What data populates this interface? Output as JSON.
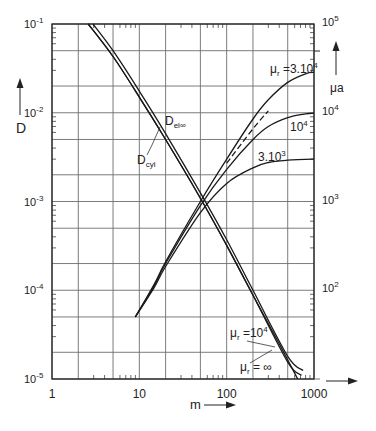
{
  "chart_data": {
    "type": "line",
    "title": "",
    "xlabel": "m",
    "ylabel_left": "D",
    "ylabel_right": "μa",
    "xscale": "log",
    "yscale": "log",
    "xlim": [
      1,
      1000
    ],
    "ylim_left": [
      1e-05,
      0.1
    ],
    "ylim_right": [
      10.0,
      100000.0
    ],
    "x_ticks": [
      {
        "value": 1,
        "label": "1"
      },
      {
        "value": 10,
        "label": "10"
      },
      {
        "value": 100,
        "label": "100"
      },
      {
        "value": 1000,
        "label": "1000"
      }
    ],
    "y_left_ticks": [
      {
        "exp": -1,
        "label": "10",
        "sup": "-1"
      },
      {
        "exp": -2,
        "label": "10",
        "sup": "-2"
      },
      {
        "exp": -3,
        "label": "10",
        "sup": "-3"
      },
      {
        "exp": -4,
        "label": "10",
        "sup": "-4"
      },
      {
        "exp": -5,
        "label": "10",
        "sup": "-5"
      }
    ],
    "y_right_ticks": [
      {
        "exp": 5,
        "label": "10",
        "sup": "5"
      },
      {
        "exp": 4,
        "label": "10",
        "sup": "4"
      },
      {
        "exp": 3,
        "label": "10",
        "sup": "3"
      },
      {
        "exp": 2,
        "label": "10",
        "sup": "2"
      }
    ],
    "grid_x": [
      1,
      2,
      5,
      10,
      20,
      50,
      100,
      200,
      500,
      1000
    ],
    "grid_y": [
      0.1,
      0.05,
      0.02,
      0.01,
      0.005,
      0.002,
      0.001,
      0.0005,
      0.0002,
      0.0001,
      5e-05,
      2e-05,
      1e-05
    ],
    "series": [
      {
        "name": "D_el∞",
        "axis": "left",
        "style": "solid",
        "points": [
          [
            2.95,
            0.1
          ],
          [
            5,
            0.05
          ],
          [
            10,
            0.0175
          ],
          [
            20,
            0.0058
          ],
          [
            50,
            0.00125
          ],
          [
            100,
            0.00037
          ],
          [
            200,
            0.0001
          ],
          [
            500,
            1.8e-05
          ],
          [
            750,
            1.25e-05
          ]
        ]
      },
      {
        "name": "D_cyl (μr = 10^4)",
        "axis": "left",
        "style": "solid",
        "points": [
          [
            2.6,
            0.1
          ],
          [
            5,
            0.043
          ],
          [
            10,
            0.015
          ],
          [
            20,
            0.005
          ],
          [
            50,
            0.00109
          ],
          [
            100,
            0.00032
          ],
          [
            200,
            8.8e-05
          ],
          [
            500,
            1.55e-05
          ],
          [
            720,
            1.1e-05
          ]
        ]
      },
      {
        "name": "D_cyl (μr = ∞)",
        "axis": "left",
        "style": "solid",
        "points": [
          [
            2.6,
            0.1
          ],
          [
            5,
            0.043
          ],
          [
            10,
            0.015
          ],
          [
            20,
            0.005
          ],
          [
            50,
            0.00109
          ],
          [
            100,
            0.00032
          ],
          [
            200,
            8.8e-05
          ],
          [
            400,
            2.5e-05
          ],
          [
            650,
            1e-05
          ]
        ]
      },
      {
        "name": "μa (μr = 3·10^4)",
        "axis": "right",
        "style": "solid",
        "points": [
          [
            9,
            50
          ],
          [
            15,
            120
          ],
          [
            20,
            210
          ],
          [
            50,
            1000
          ],
          [
            100,
            3000
          ],
          [
            200,
            8500
          ],
          [
            300,
            14000
          ],
          [
            500,
            22000
          ],
          [
            800,
            27500
          ],
          [
            1000,
            28500
          ]
        ]
      },
      {
        "name": "μa (μr = 10^4)",
        "axis": "right",
        "style": "solid",
        "points": [
          [
            9,
            50
          ],
          [
            15,
            115
          ],
          [
            20,
            200
          ],
          [
            50,
            900
          ],
          [
            100,
            2300
          ],
          [
            200,
            5000
          ],
          [
            300,
            7000
          ],
          [
            500,
            8800
          ],
          [
            800,
            9700
          ],
          [
            1000,
            9900
          ]
        ]
      },
      {
        "name": "μa (μr = 3·10^3)",
        "axis": "right",
        "style": "solid",
        "points": [
          [
            9,
            50
          ],
          [
            15,
            110
          ],
          [
            20,
            185
          ],
          [
            50,
            750
          ],
          [
            100,
            1600
          ],
          [
            200,
            2400
          ],
          [
            300,
            2750
          ],
          [
            500,
            2920
          ],
          [
            1000,
            3000
          ]
        ]
      },
      {
        "name": "μa (μr = ∞, asymptote)",
        "axis": "right",
        "style": "dashed",
        "points": [
          [
            100,
            2700
          ],
          [
            200,
            6600
          ],
          [
            300,
            10500
          ]
        ]
      }
    ],
    "annotations": [
      {
        "text": "D",
        "sub": "el∞",
        "x": 165,
        "y": 125
      },
      {
        "text": "D",
        "sub": "cyl",
        "x": 137,
        "y": 164
      },
      {
        "text": "μ",
        "sub": "r",
        "rest": " =3.10",
        "sup": "4",
        "x": 270,
        "y": 73
      },
      {
        "text": "10",
        "sup": "4",
        "x": 290,
        "y": 131
      },
      {
        "text": "3.10",
        "sup": "3",
        "x": 258,
        "y": 161
      },
      {
        "text": "μ",
        "sub": "r",
        "rest": " =10",
        "sup": "4",
        "x": 230,
        "y": 337
      },
      {
        "text": "μ",
        "sub": "r",
        "rest": " = ∞",
        "x": 240,
        "y": 371
      }
    ]
  }
}
